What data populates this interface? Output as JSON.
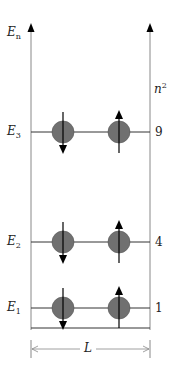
{
  "diagram": {
    "left_axis_label": {
      "main": "E",
      "sub": "n"
    },
    "right_axis_label": {
      "main": "n",
      "sup": "2"
    },
    "width_label": "L",
    "levels": [
      {
        "label_main": "E",
        "label_sub": "3",
        "n_squared": "9",
        "spins": [
          "down",
          "up"
        ]
      },
      {
        "label_main": "E",
        "label_sub": "2",
        "n_squared": "4",
        "spins": [
          "down",
          "up"
        ]
      },
      {
        "label_main": "E",
        "label_sub": "1",
        "n_squared": "1",
        "spins": [
          "down",
          "up"
        ]
      }
    ],
    "colors": {
      "particle": "#707070",
      "axis": "#888888",
      "line": "#333333",
      "arrow": "#000000"
    }
  }
}
